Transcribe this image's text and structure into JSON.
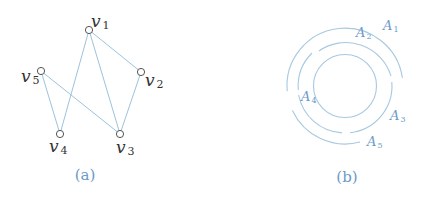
{
  "panel_a": {
    "caption": "(a)",
    "nodes": [
      {
        "id": "v1",
        "base": "v",
        "sub": "1",
        "x": 89,
        "y": 30
      },
      {
        "id": "v2",
        "base": "v",
        "sub": "2",
        "x": 141,
        "y": 72
      },
      {
        "id": "v3",
        "base": "v",
        "sub": "3",
        "x": 120,
        "y": 134
      },
      {
        "id": "v4",
        "base": "v",
        "sub": "4",
        "x": 60,
        "y": 134
      },
      {
        "id": "v5",
        "base": "v",
        "sub": "5",
        "x": 41,
        "y": 71
      }
    ],
    "edges": [
      [
        "v1",
        "v4"
      ],
      [
        "v1",
        "v3"
      ],
      [
        "v1",
        "v2"
      ],
      [
        "v2",
        "v3"
      ],
      [
        "v5",
        "v4"
      ],
      [
        "v5",
        "v3"
      ]
    ]
  },
  "panel_b": {
    "caption": "(b)",
    "center": {
      "x": 345,
      "y": 86
    },
    "arcs": [
      {
        "id": "A1",
        "base": "A",
        "sub": "1",
        "ring": "outer"
      },
      {
        "id": "A2",
        "base": "A",
        "sub": "2",
        "ring": "middle"
      },
      {
        "id": "A3",
        "base": "A",
        "sub": "3",
        "ring": "middle"
      },
      {
        "id": "A4",
        "base": "A",
        "sub": "4",
        "ring": "middle"
      },
      {
        "id": "A5",
        "base": "A",
        "sub": "5",
        "ring": "outer"
      }
    ]
  }
}
